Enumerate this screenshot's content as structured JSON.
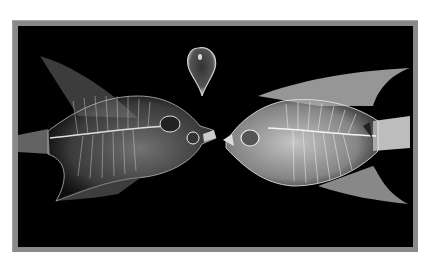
{
  "image": {
    "description": "X-ray photograph of two angelfish skeletons facing each other with a bubble-shaped object between them",
    "subjects": [
      "left-fish-xray",
      "right-fish-xray",
      "bubble-xray"
    ],
    "colors": {
      "background": "#000000",
      "frame": "#8a8a8a",
      "page": "#ffffff",
      "bone": "#e6e6e6"
    }
  }
}
